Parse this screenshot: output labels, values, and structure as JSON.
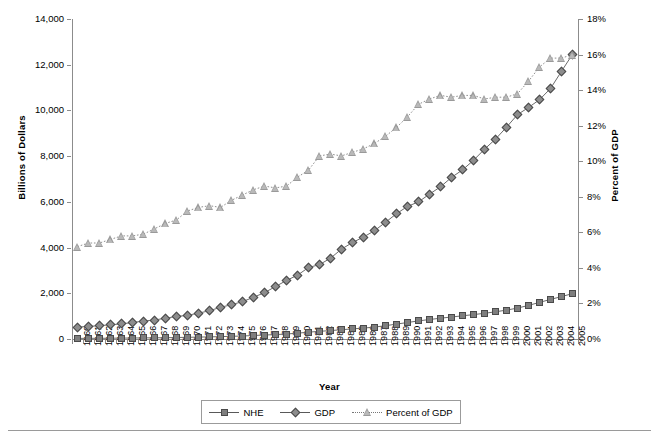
{
  "chart_data": {
    "type": "line",
    "title": "",
    "xlabel": "Year",
    "ylabel": "Billions of Dollars",
    "y2label": "Percent of GDP",
    "ylim": [
      0,
      14000
    ],
    "y2lim": [
      0,
      18
    ],
    "grid": false,
    "legend_position": "bottom",
    "categories": [
      "1960",
      "1961",
      "1962",
      "1963",
      "1964",
      "1965",
      "1966",
      "1967",
      "1968",
      "1969",
      "1970",
      "1971",
      "1972",
      "1973",
      "1974",
      "1975",
      "1976",
      "1977",
      "1978",
      "1979",
      "1980",
      "1981",
      "1982",
      "1983",
      "1984",
      "1985",
      "1986",
      "1987",
      "1988",
      "1989",
      "1990",
      "1991",
      "1992",
      "1993",
      "1994",
      "1995",
      "1996",
      "1997",
      "1998",
      "1999",
      "2000",
      "2001",
      "2002",
      "2003",
      "2004",
      "2005"
    ],
    "ytick_labels": [
      "0",
      "2,000",
      "4,000",
      "6,000",
      "8,000",
      "10,000",
      "12,000",
      "14,000"
    ],
    "ytick_values": [
      0,
      2000,
      4000,
      6000,
      8000,
      10000,
      12000,
      14000
    ],
    "y2tick_labels": [
      "0%",
      "2%",
      "4%",
      "6%",
      "8%",
      "10%",
      "12%",
      "14%",
      "16%",
      "18%"
    ],
    "y2tick_values": [
      0,
      2,
      4,
      6,
      8,
      10,
      12,
      14,
      16,
      18
    ],
    "series": [
      {
        "name": "NHE",
        "axis": "left",
        "marker": "square",
        "line": "solid",
        "color": "#7e7e7e",
        "values": [
          27,
          29,
          32,
          35,
          39,
          42,
          46,
          52,
          59,
          66,
          75,
          83,
          93,
          103,
          117,
          133,
          153,
          174,
          194,
          220,
          255,
          296,
          335,
          369,
          406,
          444,
          477,
          521,
          584,
          651,
          724,
          791,
          855,
          912,
          963,
          1017,
          1069,
          1125,
          1191,
          1265,
          1353,
          1470,
          1603,
          1733,
          1855,
          1988
        ]
      },
      {
        "name": "GDP",
        "axis": "left",
        "marker": "diamond",
        "line": "solid",
        "color": "#8d8d8d",
        "values": [
          526,
          545,
          586,
          618,
          664,
          719,
          788,
          833,
          910,
          985,
          1039,
          1128,
          1240,
          1386,
          1501,
          1635,
          1824,
          2031,
          2294,
          2563,
          2790,
          3128,
          3255,
          3537,
          3933,
          4220,
          4463,
          4740,
          5104,
          5484,
          5803,
          5996,
          6338,
          6657,
          7072,
          7398,
          7817,
          8304,
          8747,
          9268,
          9817,
          10128,
          10470,
          10961,
          11713,
          12456
        ]
      },
      {
        "name": "Percent of GDP",
        "axis": "right",
        "marker": "triangle",
        "line": "dotted",
        "color": "#9a9a9a",
        "values": [
          5.2,
          5.4,
          5.4,
          5.6,
          5.8,
          5.8,
          5.9,
          6.2,
          6.5,
          6.7,
          7.2,
          7.4,
          7.5,
          7.4,
          7.8,
          8.1,
          8.4,
          8.6,
          8.5,
          8.6,
          9.1,
          9.5,
          10.3,
          10.4,
          10.3,
          10.5,
          10.7,
          11.0,
          11.4,
          11.9,
          12.5,
          13.2,
          13.5,
          13.7,
          13.6,
          13.7,
          13.7,
          13.5,
          13.6,
          13.6,
          13.8,
          14.5,
          15.3,
          15.8,
          15.8,
          16.0
        ]
      }
    ]
  },
  "legend": {
    "items": [
      {
        "label": "NHE"
      },
      {
        "label": "GDP"
      },
      {
        "label": "Percent of GDP"
      }
    ]
  }
}
